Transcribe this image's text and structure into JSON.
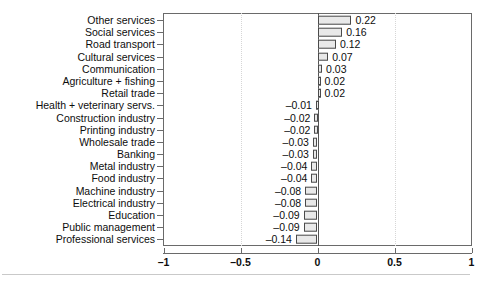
{
  "chart_data": {
    "type": "bar",
    "orientation": "horizontal",
    "title": "",
    "xlabel": "",
    "ylabel": "",
    "xlim": [
      -1,
      1
    ],
    "xticks": [
      -1,
      -0.5,
      0,
      0.5,
      1
    ],
    "xticklabels": [
      "–1",
      "–0.5",
      "0",
      "0.5",
      "1"
    ],
    "grid": "vertical dotted at -0.5 and 0.5",
    "legend": "none",
    "zero_reference_line": true,
    "categories": [
      "Other services",
      "Social services",
      "Road transport",
      "Cultural services",
      "Communication",
      "Agriculture + fishing",
      "Retail trade",
      "Health + veterinary servs.",
      "Construction industry",
      "Printing industry",
      "Wholesale trade",
      "Banking",
      "Metal industry",
      "Food industry",
      "Machine industry",
      "Electrical industry",
      "Education",
      "Public management",
      "Professional services"
    ],
    "values": [
      0.22,
      0.16,
      0.12,
      0.07,
      0.03,
      0.02,
      0.02,
      -0.01,
      -0.02,
      -0.02,
      -0.03,
      -0.03,
      -0.04,
      -0.04,
      -0.08,
      -0.08,
      -0.09,
      -0.09,
      -0.14
    ],
    "value_labels": [
      "0.22",
      "0.16",
      "0.12",
      "0.07",
      "0.03",
      "0.02",
      "0.02",
      "–0.01",
      "–0.02",
      "–0.02",
      "–0.03",
      "–0.03",
      "–0.04",
      "–0.04",
      "–0.08",
      "–0.08",
      "–0.09",
      "–0.09",
      "–0.14"
    ],
    "bar_fill_color": "#e9e9e9",
    "bar_edge_color": "#4a4a4a",
    "axis_color": "#6a6a6a",
    "gridline_color": "#d6d6d6"
  },
  "caption": ""
}
